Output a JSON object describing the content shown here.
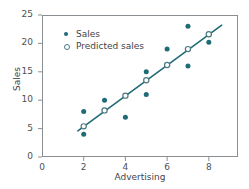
{
  "chart_data": {
    "type": "scatter",
    "title": "",
    "xlabel": "Advertising",
    "ylabel": "Sales",
    "xlim": [
      0,
      9.4
    ],
    "ylim": [
      0,
      25
    ],
    "xticks": [
      "0",
      "2",
      "4",
      "6",
      "8"
    ],
    "xtick_values": [
      0,
      2,
      4,
      6,
      8
    ],
    "yticks": [
      "0",
      "5",
      "10",
      "15",
      "20",
      "25"
    ],
    "ytick_values": [
      0,
      5,
      10,
      15,
      20,
      25
    ],
    "grid": false,
    "legend_position": "upper left",
    "accent_color": "#1f6b76",
    "line_color": "#1f6b76",
    "open_marker_edge": "#4c787f",
    "frame_color": "#8a8f94",
    "series": [
      {
        "name": "Sales",
        "marker": "filled-circle",
        "color": "#1f6b76",
        "x": [
          2,
          2,
          3,
          4,
          5,
          5,
          6,
          7,
          7,
          8
        ],
        "y": [
          8,
          4,
          10,
          7,
          15,
          11,
          19,
          23,
          16,
          20.2
        ]
      },
      {
        "name": "Predicted sales",
        "marker": "open-circle",
        "color": "#4c787f",
        "x": [
          2,
          3,
          4,
          5,
          6,
          7,
          8
        ],
        "y": [
          5.4,
          8.2,
          10.8,
          13.5,
          16.2,
          19.0,
          21.6
        ]
      }
    ],
    "trendline": {
      "name": "regression line",
      "x_start": 1.72,
      "y_start": 4.6,
      "x_end": 8.62,
      "y_end": 23.2,
      "color": "#1f6b76"
    }
  },
  "legend": {
    "items": [
      {
        "label": "Sales",
        "marker": "filled-circle"
      },
      {
        "label": "Predicted sales",
        "marker": "open-circle"
      }
    ]
  }
}
